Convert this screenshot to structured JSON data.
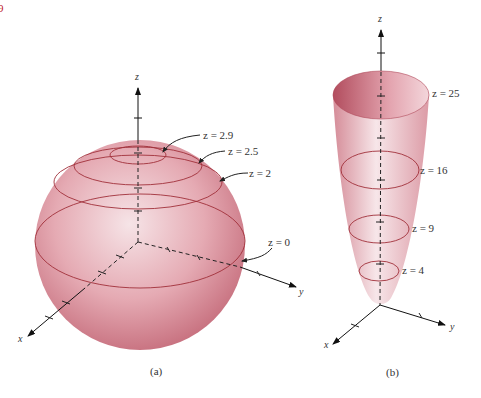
{
  "figure": {
    "corner_mark": "9",
    "corner_mark_color": "#c0202a",
    "surface_color": "#d88a96",
    "curve_color": "#a0303a",
    "panel_a": {
      "caption": "(a)",
      "axes": {
        "x": "x",
        "y": "y",
        "z": "z"
      },
      "level_labels": [
        "z = 2.9",
        "z = 2.5",
        "z = 2",
        "z = 0"
      ]
    },
    "panel_b": {
      "caption": "(b)",
      "axes": {
        "x": "x",
        "y": "y",
        "z": "z"
      },
      "level_labels": [
        "z = 25",
        "z = 16",
        "z = 9",
        "z = 4"
      ]
    }
  }
}
